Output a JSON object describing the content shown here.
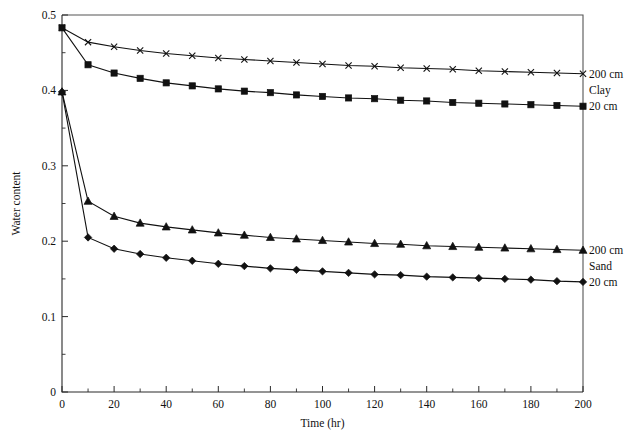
{
  "chart_data": {
    "type": "line",
    "title": "",
    "xlabel": "Time (hr)",
    "ylabel": "Water content",
    "xlim": [
      0,
      200
    ],
    "ylim": [
      0,
      0.5
    ],
    "xticks": [
      0,
      20,
      40,
      60,
      80,
      100,
      120,
      140,
      160,
      180,
      200
    ],
    "xtick_labels": [
      "0",
      "20",
      "40",
      "60",
      "80",
      "100",
      "120",
      "140",
      "160",
      "180",
      "200"
    ],
    "yticks": [
      0,
      0.1,
      0.2,
      0.3,
      0.4,
      0.5
    ],
    "ytick_labels": [
      "0",
      "0.1",
      "0.2",
      "0.3",
      "0.4",
      "0.5"
    ],
    "yminor_ticks": [
      0.05,
      0.15,
      0.25,
      0.35,
      0.45
    ],
    "xminor_ticks": [
      10,
      30,
      50,
      70,
      90,
      110,
      130,
      150,
      170,
      190
    ],
    "grid": false,
    "legend_position": "right-inline",
    "marker_interval": 10,
    "series": [
      {
        "name": "clay-200cm",
        "label": "200 cm",
        "group": "Clay",
        "marker": "cross",
        "color": "#111111",
        "x": [
          0,
          10,
          20,
          30,
          40,
          50,
          60,
          70,
          80,
          90,
          100,
          110,
          120,
          130,
          140,
          150,
          160,
          170,
          180,
          190,
          200
        ],
        "y": [
          0.483,
          0.464,
          0.458,
          0.453,
          0.449,
          0.446,
          0.443,
          0.441,
          0.439,
          0.437,
          0.435,
          0.433,
          0.432,
          0.43,
          0.429,
          0.428,
          0.426,
          0.425,
          0.424,
          0.423,
          0.422
        ]
      },
      {
        "name": "clay-20cm",
        "label": "20 cm",
        "group": "Clay",
        "marker": "square",
        "color": "#111111",
        "x": [
          0,
          10,
          20,
          30,
          40,
          50,
          60,
          70,
          80,
          90,
          100,
          110,
          120,
          130,
          140,
          150,
          160,
          170,
          180,
          190,
          200
        ],
        "y": [
          0.483,
          0.434,
          0.423,
          0.416,
          0.41,
          0.406,
          0.402,
          0.399,
          0.397,
          0.394,
          0.392,
          0.39,
          0.389,
          0.387,
          0.386,
          0.384,
          0.383,
          0.382,
          0.381,
          0.38,
          0.379
        ]
      },
      {
        "name": "sand-200cm",
        "label": "200 cm",
        "group": "Sand",
        "marker": "triangle",
        "color": "#111111",
        "x": [
          0,
          10,
          20,
          30,
          40,
          50,
          60,
          70,
          80,
          90,
          100,
          110,
          120,
          130,
          140,
          150,
          160,
          170,
          180,
          190,
          200
        ],
        "y": [
          0.398,
          0.253,
          0.233,
          0.224,
          0.219,
          0.215,
          0.211,
          0.208,
          0.205,
          0.203,
          0.201,
          0.199,
          0.197,
          0.196,
          0.194,
          0.193,
          0.192,
          0.191,
          0.19,
          0.189,
          0.188
        ]
      },
      {
        "name": "sand-20cm",
        "label": "20 cm",
        "group": "Sand",
        "marker": "diamond",
        "color": "#111111",
        "x": [
          0,
          10,
          20,
          30,
          40,
          50,
          60,
          70,
          80,
          90,
          100,
          110,
          120,
          130,
          140,
          150,
          160,
          170,
          180,
          190,
          200
        ],
        "y": [
          0.398,
          0.205,
          0.19,
          0.183,
          0.178,
          0.174,
          0.17,
          0.167,
          0.164,
          0.162,
          0.16,
          0.158,
          0.156,
          0.155,
          0.153,
          0.152,
          0.151,
          0.15,
          0.149,
          0.147,
          0.146
        ]
      }
    ],
    "annotations": [
      {
        "name": "clay-200cm-label",
        "text": "200 cm",
        "at": [
          200,
          0.422
        ]
      },
      {
        "name": "clay-group-label",
        "text": "Clay",
        "at": [
          200,
          0.4005
        ]
      },
      {
        "name": "clay-20cm-label",
        "text": "20 cm",
        "at": [
          200,
          0.379
        ]
      },
      {
        "name": "sand-200cm-label",
        "text": "200 cm",
        "at": [
          200,
          0.188
        ]
      },
      {
        "name": "sand-group-label",
        "text": "Sand",
        "at": [
          200,
          0.167
        ]
      },
      {
        "name": "sand-20cm-label",
        "text": "20 cm",
        "at": [
          200,
          0.146
        ]
      }
    ]
  }
}
